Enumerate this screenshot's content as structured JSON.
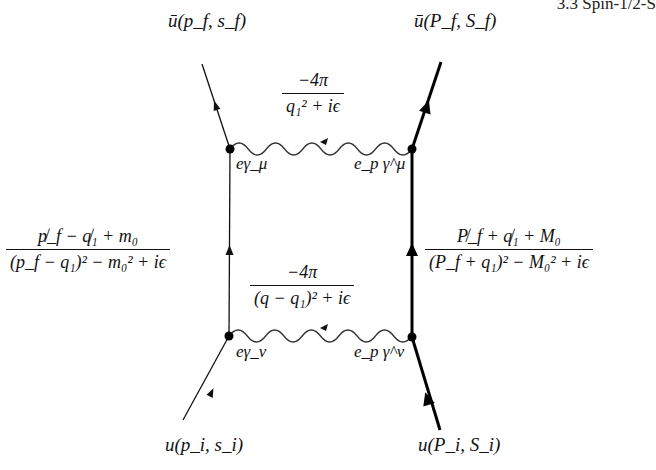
{
  "header": {
    "section": "3.3  Spin-1/2-S"
  },
  "external_states": {
    "electron_out": "ū(p_f, s_f)",
    "proton_out": "ū(P_f, S_f)",
    "electron_in": "u(p_i, s_i)",
    "proton_in": "u(P_i, S_i)"
  },
  "propagators": {
    "photon_top": {
      "numerator": "−4π",
      "denominator": "q₁² + iϵ"
    },
    "photon_bottom": {
      "numerator": "−4π",
      "denominator": "(q − q₁)² + iϵ"
    },
    "electron": {
      "numerator": "p̸_f − q̸₁ + m₀",
      "denominator": "(p_f − q₁)² − m₀² + iϵ"
    },
    "proton": {
      "numerator": "P̸_f + q̸₁ + M₀",
      "denominator": "(P_f + q₁)² − M₀² + iϵ"
    }
  },
  "vertices": {
    "electron_top": "eγ_μ",
    "proton_top": "e_p γ^μ",
    "electron_bottom": "eγ_ν",
    "proton_bottom": "e_p γ^ν"
  },
  "colors": {
    "line": "#111111",
    "photon": "#333333"
  }
}
